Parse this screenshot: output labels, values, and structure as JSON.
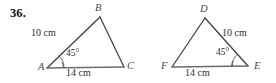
{
  "exercise": {
    "number": "36."
  },
  "figures": [
    {
      "id": "triangle-abc",
      "vertices": [
        {
          "name": "A",
          "label": "A"
        },
        {
          "name": "B",
          "label": "B"
        },
        {
          "name": "C",
          "label": "C"
        }
      ],
      "side_labels": [
        {
          "name": "side-ab",
          "text": "10 cm"
        },
        {
          "name": "side-ac",
          "text": "14 cm"
        }
      ],
      "angle_labels": [
        {
          "name": "angle-a",
          "text": "45°"
        }
      ]
    },
    {
      "id": "triangle-def",
      "vertices": [
        {
          "name": "D",
          "label": "D"
        },
        {
          "name": "E",
          "label": "E"
        },
        {
          "name": "F",
          "label": "F"
        }
      ],
      "side_labels": [
        {
          "name": "side-de",
          "text": "10 cm"
        },
        {
          "name": "side-fe",
          "text": "14 cm"
        }
      ],
      "angle_labels": [
        {
          "name": "angle-e",
          "text": "45°"
        }
      ]
    }
  ],
  "colors": {
    "stroke": "#3a3a3a",
    "base_stroke": "#6b6b6b",
    "text": "#2d2d2d",
    "vertex_text": "#4a4a4a"
  }
}
